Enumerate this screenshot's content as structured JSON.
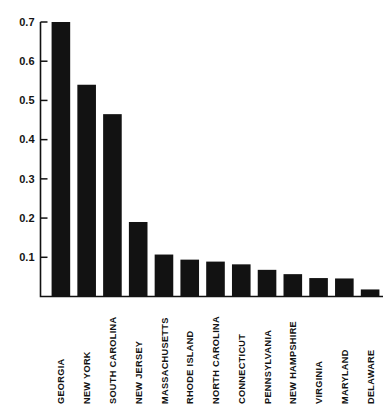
{
  "chart_data": {
    "type": "bar",
    "title": "",
    "subtitle": "",
    "xlabel": "",
    "ylabel": "",
    "ylim": [
      0,
      0.7
    ],
    "grid": false,
    "legend": null,
    "y_ticks": [
      0.1,
      0.2,
      0.3,
      0.4,
      0.5,
      0.6,
      0.7
    ],
    "y_tick_labels": [
      "0.1",
      "0.2",
      "0.3",
      "0.4",
      "0.5",
      "0.6",
      "0.7"
    ],
    "categories": [
      "GEORGIA",
      "NEW YORK",
      "SOUTH  CAROLINA",
      "NEW JERSEY",
      "MASSACHUSETTS",
      "RHODE  ISLAND",
      "NORTH  CAROLINA",
      "CONNECTICUT",
      "PENNSYLVANIA",
      "NEW  HAMPSHIRE",
      "VIRGINIA",
      "MARYLAND",
      "DELAWARE"
    ],
    "values": [
      0.7,
      0.54,
      0.465,
      0.19,
      0.107,
      0.094,
      0.089,
      0.082,
      0.068,
      0.057,
      0.047,
      0.046,
      0.018
    ],
    "bar_color": "#121212",
    "axis_color": "#111111",
    "background_color": "#ffffff",
    "orientation": "vertical",
    "category_label_rotation": -90
  }
}
